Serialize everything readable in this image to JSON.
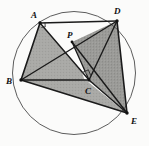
{
  "figure": {
    "background_color": "#fbfbfa",
    "stroke_color": "#1a1a1a",
    "circle_stroke_color": "#4a4a4a",
    "shade_fill_color": "#a9a9a6",
    "shade_fill_color_dark": "#9a9a97",
    "white_fill_color": "#fdfdfc"
  },
  "circle": {
    "name": "circumscribed-circle",
    "cx": 74,
    "cy": 73,
    "r": 61.5,
    "stroke_width": 0.9
  },
  "points": [
    {
      "id": "A",
      "label": "A",
      "x": 40,
      "y": 23,
      "label_x": 31,
      "label_y": 18
    },
    {
      "id": "D",
      "label": "D",
      "x": 117,
      "y": 21,
      "label_x": 114,
      "label_y": 14
    },
    {
      "id": "B",
      "label": "B",
      "x": 21,
      "y": 80,
      "label_x": 10,
      "label_y": 84
    },
    {
      "id": "C",
      "label": "C",
      "x": 89,
      "y": 80,
      "label_x": 86,
      "label_y": 93
    },
    {
      "id": "E",
      "label": "E",
      "x": 127,
      "y": 113,
      "label_x": 132,
      "label_y": 122
    },
    {
      "id": "P",
      "label": "P",
      "x": 72,
      "y": 42,
      "label_x": 68,
      "label_y": 37
    }
  ],
  "segments": [
    {
      "name": "segment-AD",
      "from": "A",
      "to": "D"
    },
    {
      "name": "segment-AB",
      "from": "A",
      "to": "B"
    },
    {
      "name": "segment-BE",
      "from": "B",
      "to": "E"
    },
    {
      "name": "segment-DE",
      "from": "D",
      "to": "E"
    },
    {
      "name": "segment-AC",
      "from": "A",
      "to": "C"
    },
    {
      "name": "segment-BC",
      "from": "B",
      "to": "C"
    },
    {
      "name": "segment-BD",
      "from": "B",
      "to": "D"
    },
    {
      "name": "segment-CD",
      "from": "C",
      "to": "D"
    },
    {
      "name": "segment-CE",
      "from": "C",
      "to": "E"
    },
    {
      "name": "segment-PE",
      "from": "P",
      "to": "E"
    },
    {
      "name": "segment-PC",
      "from": "P",
      "to": "C"
    }
  ],
  "shaded_regions": [
    {
      "name": "region-ABC",
      "vertices": [
        "A",
        "B",
        "C"
      ],
      "shade": "light"
    },
    {
      "name": "region-BCE",
      "vertices": [
        "B",
        "C",
        "E"
      ],
      "shade": "light"
    },
    {
      "name": "region-PDC",
      "vertices": [
        "P",
        "D",
        "C"
      ],
      "shade": "dark"
    },
    {
      "name": "region-CDE",
      "vertices": [
        "C",
        "D",
        "E"
      ],
      "shade": "dark"
    }
  ],
  "angle_marks": [
    {
      "name": "right-angle-mark-at-C",
      "vertex": "C",
      "type": "right-angle"
    },
    {
      "name": "angle-mark-at-A",
      "vertex": "A",
      "type": "right-angle-small"
    }
  ]
}
